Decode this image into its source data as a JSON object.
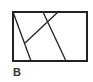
{
  "figure": {
    "label": "B",
    "stroke_color": "#222222",
    "rectangle": {
      "x": 13,
      "y": 12,
      "width": 74,
      "height": 49
    },
    "lines": [
      {
        "x1": 13,
        "y1": 12,
        "x2": 31,
        "y2": 61
      },
      {
        "x1": 43,
        "y1": 12,
        "x2": 66,
        "y2": 61
      },
      {
        "x1": 58,
        "y1": 12,
        "x2": 25,
        "y2": 43
      }
    ]
  }
}
